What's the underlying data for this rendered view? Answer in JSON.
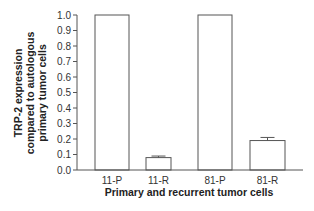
{
  "chart_data": {
    "type": "bar",
    "title": "",
    "xlabel": "Primary and recurrent tumor cells",
    "ylabel_lines": [
      "TRP-2 expression",
      "compared to autologous",
      "primary tumor cells"
    ],
    "ylabel": "TRP-2 expression compared to autologous primary tumor cells",
    "categories": [
      "11-P",
      "11-R",
      "81-P",
      "81-R"
    ],
    "values": [
      1.0,
      0.08,
      1.0,
      0.19
    ],
    "error_upper": [
      null,
      0.09,
      null,
      0.21
    ],
    "ylim": [
      0,
      1.0
    ],
    "yticks": [
      "0.0",
      "0.1",
      "0.2",
      "0.3",
      "0.4",
      "0.5",
      "0.6",
      "0.7",
      "0.8",
      "0.9",
      "1.0"
    ],
    "grid": false,
    "legend": null,
    "colors": {
      "bar_fill": "#ffffff",
      "bar_stroke": "#555555",
      "axis": "#555555"
    }
  }
}
